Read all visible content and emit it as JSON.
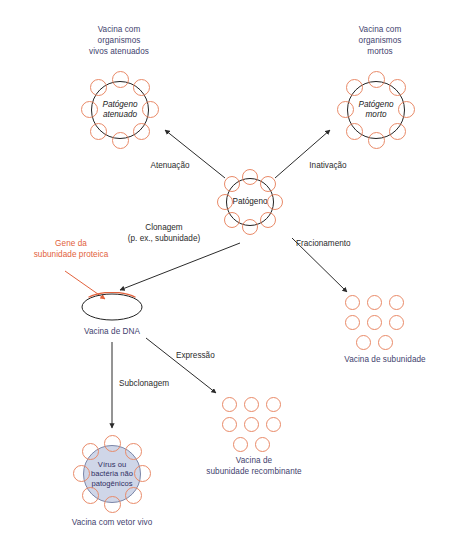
{
  "diagram": {
    "colors": {
      "label_blue": "#3f3f6e",
      "accent_orange": "#e2613b",
      "spike_orange": "#e98a68",
      "vector_fill": "#cfd6e8",
      "vector_stroke": "#7b86a8",
      "arrow_black": "#2b2b2b",
      "background": "#ffffff"
    },
    "nodes": {
      "pathogen": {
        "core_text": "Patógeno",
        "spike_count": 8
      },
      "attenuated_pathogen": {
        "core_text": "Patógeno\natenuado",
        "spike_count": 8,
        "caption": "Vacina com\norganismos\nvivos atenuados"
      },
      "killed_pathogen": {
        "core_text": "Patógeno\nmorto",
        "spike_count": 8,
        "caption": "Vacina com\norganismos\nmortos"
      },
      "dna_vaccine": {
        "caption": "Vacina de DNA",
        "gene_label": "Gene da\nsubunidade proteica"
      },
      "live_vector_vaccine": {
        "core_text": "Vírus ou\nbactéria não\npatogênicos",
        "spike_count": 8,
        "caption": "Vacina com vetor vivo"
      },
      "subunit_vaccine": {
        "caption": "Vacina de subunidade",
        "unit_count": 8,
        "rows": [
          3,
          3,
          2
        ]
      },
      "recombinant_subunit_vaccine": {
        "caption": "Vacina de\nsubunidade recombinante",
        "unit_count": 8,
        "rows": [
          3,
          3,
          2
        ]
      }
    },
    "edges": {
      "attenuation": "Atenuação",
      "inactivation": "Inativação",
      "cloning": "Clonagem\n(p. ex., subunidade)",
      "fractionation": "Fracionamento",
      "expression": "Expressão",
      "subcloning": "Subclonagem"
    }
  }
}
